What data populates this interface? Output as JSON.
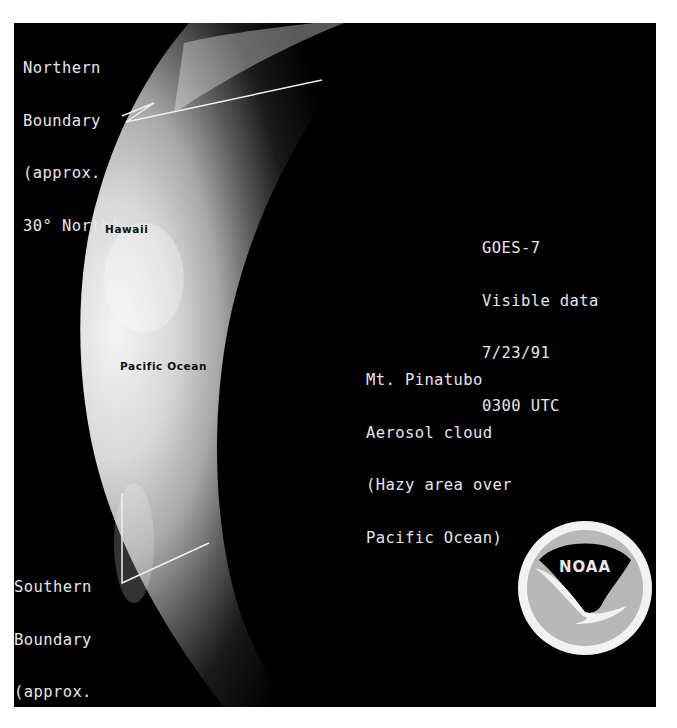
{
  "image": {
    "type": "satellite-visible-image",
    "subject": "earth-limb-crescent"
  },
  "annotations": {
    "northern_boundary": {
      "lines": [
        "Northern",
        "Boundary",
        "(approx.",
        "30° North)"
      ]
    },
    "southern_boundary": {
      "lines": [
        "Southern",
        "Boundary",
        "(approx.",
        "20° South)"
      ]
    },
    "satellite_info": {
      "lines": [
        "GOES-7",
        "Visible data",
        "7/23/91",
        "0300 UTC"
      ]
    },
    "aerosol_note": {
      "lines": [
        "Mt. Pinatubo",
        "Aerosol cloud",
        "(Hazy area over",
        "Pacific Ocean)"
      ]
    },
    "place_labels": {
      "hawaii": "Hawaii",
      "pacific_ocean": "Pacific Ocean"
    }
  },
  "logo": {
    "text": "NOAA",
    "colors": {
      "ring": "#f2f2f2",
      "top": "#000000",
      "bottom": "#b8b8b8"
    }
  },
  "colors": {
    "space": "#000000",
    "page": "#ffffff",
    "text": "#e6e6e6"
  }
}
